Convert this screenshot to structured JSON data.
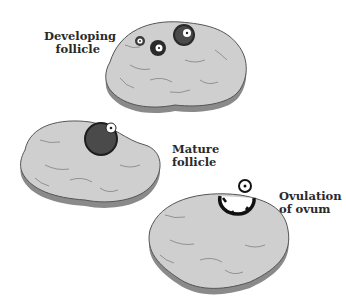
{
  "diagram": {
    "colors": {
      "ovary_fill": "#cfcfcf",
      "ovary_shadow": "#8a8a8a",
      "ovary_outline": "#555555",
      "follicle_dark": "#3a3a3a",
      "ovum_white": "#ffffff",
      "text": "#2a2a2a"
    },
    "stages": [
      {
        "id": "developing",
        "label_line1": "Developing",
        "label_line2": "follicle"
      },
      {
        "id": "mature",
        "label_line1": "Mature",
        "label_line2": "follicle"
      },
      {
        "id": "ovulation",
        "label_line1": "Ovulation",
        "label_line2": "of ovum"
      }
    ]
  }
}
